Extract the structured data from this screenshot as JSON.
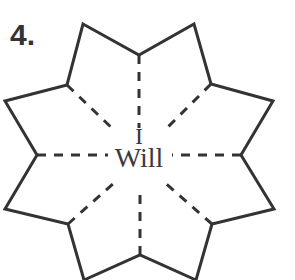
{
  "figure": {
    "number_label": "4.",
    "center_text_line1": "I",
    "center_text_line2": "Will",
    "shape": "eight-pointed star outline with dashed radial fold lines",
    "stroke_color": "#333333"
  }
}
